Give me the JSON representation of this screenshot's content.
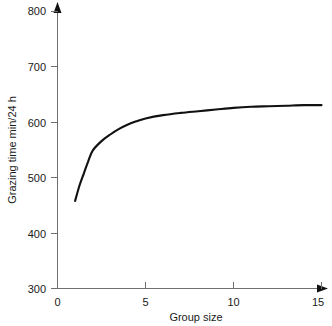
{
  "chart_data": {
    "type": "line",
    "title": "",
    "subtitle": "",
    "xlabel": "Group size",
    "ylabel": "Grazing time min/24 h",
    "xlim": [
      0,
      15
    ],
    "ylim": [
      300,
      800
    ],
    "xticks": [
      "0",
      "5",
      "10",
      "15"
    ],
    "xtick_values": [
      0,
      5,
      10,
      15
    ],
    "yticks": [
      "300",
      "400",
      "500",
      "600",
      "700",
      "800"
    ],
    "ytick_values": [
      300,
      400,
      500,
      600,
      700,
      800
    ],
    "grid": false,
    "legend": null,
    "legend_position": "none",
    "annotations": [],
    "axis_color": "#6f6f6f",
    "curve_color": "#111111",
    "background_color": "#ffffff",
    "series": [
      {
        "name": "Grazing time",
        "x": [
          1,
          1.25,
          1.5,
          1.75,
          2,
          2.5,
          3,
          3.5,
          4,
          4.5,
          5,
          6,
          7,
          8,
          9,
          10,
          11,
          12,
          13,
          14,
          15
        ],
        "values": [
          458,
          486,
          508,
          530,
          549,
          566,
          578,
          588,
          596,
          602,
          607,
          613,
          617,
          620,
          623,
          626,
          628,
          629,
          630,
          631,
          631
        ]
      }
    ]
  },
  "labels": {
    "x_axis_title": "Group size",
    "y_axis_title": "Grazing time min/24 h",
    "y_800": "800",
    "y_700": "700",
    "y_600": "600",
    "y_500": "500",
    "y_400": "400",
    "y_300": "300",
    "x_0": "0",
    "x_5": "5",
    "x_10": "10",
    "x_15": "15"
  }
}
